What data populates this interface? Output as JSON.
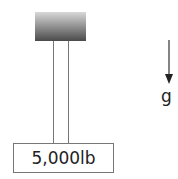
{
  "diagram": {
    "ceiling": {
      "label": "support-block",
      "gradient_top": "#d8d8d8",
      "gradient_bottom": "#4a4a4a"
    },
    "ropes": [
      {
        "name": "rope-left"
      },
      {
        "name": "rope-right"
      }
    ],
    "weight": {
      "label": "5,000lb"
    },
    "gravity": {
      "label": "g",
      "direction": "down"
    }
  }
}
